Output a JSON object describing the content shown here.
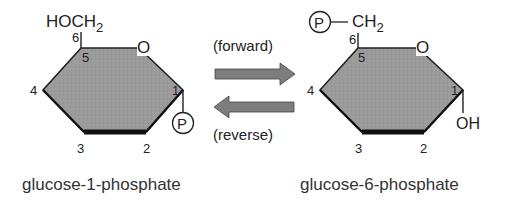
{
  "left_molecule": {
    "name": "glucose-1-phosphate",
    "substituent_c6": "HOCH",
    "substituent_c6_subscript": "2",
    "ring_oxygen": "O",
    "c1_group": "P",
    "carbon_numbers": [
      "1",
      "2",
      "3",
      "4",
      "5",
      "6"
    ]
  },
  "right_molecule": {
    "name": "glucose-6-phosphate",
    "phosphate": "P",
    "substituent_c6": "CH",
    "substituent_c6_subscript": "2",
    "ring_oxygen": "O",
    "c1_group": "OH",
    "carbon_numbers": [
      "1",
      "2",
      "3",
      "4",
      "5",
      "6"
    ]
  },
  "reaction": {
    "forward_label": "(forward)",
    "reverse_label": "(reverse)"
  },
  "colors": {
    "ring_fill": "#9a9a9a",
    "arrow_fill": "#7d7d7d",
    "outline": "#222222",
    "text": "#222222"
  }
}
